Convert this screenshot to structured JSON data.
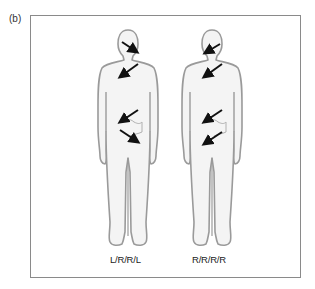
{
  "panel": {
    "label": "(b)"
  },
  "figures": [
    {
      "id": "figure-left",
      "caption": "L/R/R/L",
      "arrows": [
        {
          "region": "head",
          "direction": "L"
        },
        {
          "region": "chest",
          "direction": "R"
        },
        {
          "region": "upper-abdomen",
          "direction": "R"
        },
        {
          "region": "lower-abdomen",
          "direction": "L"
        }
      ]
    },
    {
      "id": "figure-right",
      "caption": "R/R/R/R",
      "arrows": [
        {
          "region": "head",
          "direction": "R"
        },
        {
          "region": "chest",
          "direction": "R"
        },
        {
          "region": "upper-abdomen",
          "direction": "R"
        },
        {
          "region": "lower-abdomen",
          "direction": "R"
        }
      ]
    }
  ],
  "colors": {
    "outline": "#9a9a9a",
    "fill": "#f4f4f4",
    "arrow": "#111111",
    "frame": "#8a8a8a"
  }
}
